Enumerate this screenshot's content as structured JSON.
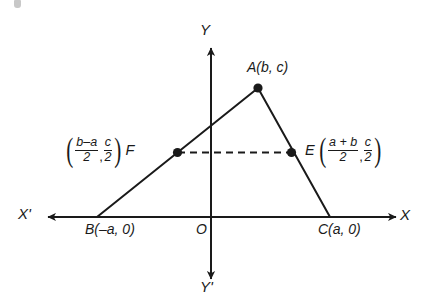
{
  "figure": {
    "background_color": "#ffffff",
    "stroke_color": "#1a1a1a",
    "axes": {
      "x_positive_label": "X",
      "x_negative_label": "X'",
      "y_positive_label": "Y",
      "y_negative_label": "Y'",
      "origin_label": "O"
    },
    "points": {
      "a": {
        "name": "A",
        "label": "A(b, c)",
        "coords": "(b, c)"
      },
      "b": {
        "name": "B",
        "label": "B(–a, 0)",
        "coords": "(–a, 0)"
      },
      "c": {
        "name": "C",
        "label": "C(a, 0)",
        "coords": "(a, 0)"
      },
      "e": {
        "name": "E",
        "tag": "E"
      },
      "f": {
        "name": "F",
        "tag": "F"
      }
    },
    "coordinate_annotations": {
      "f": {
        "tag": "F",
        "open_paren": "(",
        "close_paren": ")",
        "x_numerator": "b–a",
        "x_denominator": "2",
        "comma": ",",
        "y_numerator": "c",
        "y_denominator": "2"
      },
      "e": {
        "tag": "E",
        "open_paren": "(",
        "close_paren": ")",
        "x_numerator": "a + b",
        "x_denominator": "2",
        "comma": ",",
        "y_numerator": "c",
        "y_denominator": "2"
      }
    },
    "segments": {
      "side_ab": "A to B",
      "side_ac": "A to C",
      "side_bc": "B to C along X-axis",
      "midsegment_fe": "F to E (dashed)"
    }
  }
}
